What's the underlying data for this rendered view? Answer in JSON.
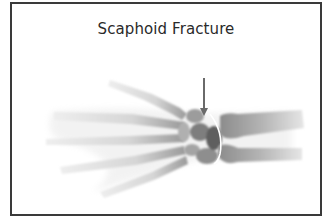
{
  "figure": {
    "title": "Scaphoid Fracture",
    "annotation": "fracture-arrow",
    "colors": {
      "frame": "#3a3a3a",
      "bone_light": "#e2e2e2",
      "bone_dark": "#8a8a8a",
      "arrow": "#6a6a6a",
      "fracture_line": "#ffffff"
    }
  }
}
